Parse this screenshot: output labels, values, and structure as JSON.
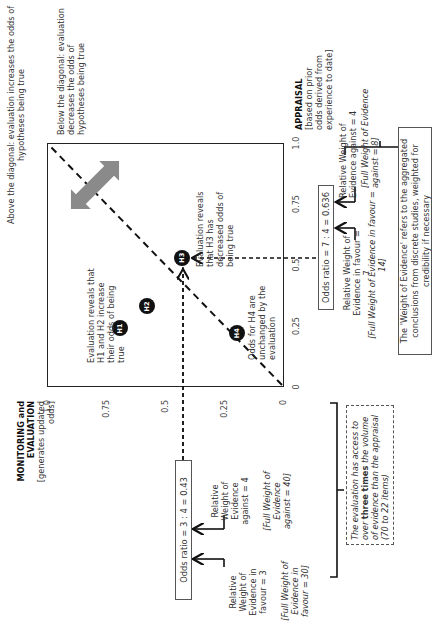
{
  "diagram": {
    "above_diagonal_note": "Above the diagonal: evaluation increases the odds of hypotheses being true",
    "below_diagonal_note": "Below the diagonal: evaluation decreases the odds of hypotheses being true",
    "y_axis": {
      "title": "MONITORING and EVALUATION",
      "subtitle": "[generates updated odds]",
      "ticks": [
        "0",
        "0.25",
        "0.5",
        "0.75",
        "1.0"
      ]
    },
    "x_axis": {
      "title": "APPRAISAL",
      "subtitle": "[based on prior odds derived from experience to date]",
      "ticks": [
        "0",
        "0.25",
        "0.5",
        "0.75",
        "1.0"
      ]
    },
    "hypotheses": [
      {
        "label": "H1",
        "appraisal": 0.24,
        "evaluation": 0.69
      },
      {
        "label": "H2",
        "appraisal": 0.33,
        "evaluation": 0.58
      },
      {
        "label": "H3",
        "appraisal": 0.53,
        "evaluation": 0.43
      },
      {
        "label": "H4",
        "appraisal": 0.22,
        "evaluation": 0.2
      }
    ],
    "annotations": {
      "h1_h2": "Evaluation reveals that H1 and H2 increase their odds of being true",
      "h3": "Evaluation reveals that H3 has decreased odds of being true",
      "h4": "Odds for H4 are unchanged by the evaluation"
    },
    "evaluation_odds": {
      "ratio_label": "Odds ratio = 3 : 4  = 0.43",
      "favour": "Relative Weight of Evidence in favour = 3",
      "favour_full": "[Full Weight of Evidence in favour = 30]",
      "against": "Relative Weight of Evidence against = 4",
      "against_full": "[Full Weight of Evidence against = 40]"
    },
    "appraisal_odds": {
      "ratio_label": "Odds ratio = 7 : 4  = 0.636",
      "favour": "Relative Weight of Evidence in favour = 7",
      "favour_full": "[Full Weight of Evidence in favour = 14]",
      "against": "Relative Weight of Evidence against = 4",
      "against_full": "[Full Weight of Evidence against = 8]"
    },
    "comparison_note": {
      "before": "The evaluation has access to over ",
      "emphasis": "three times",
      "after": " the volume of evidence than the appraisal (70  to 22 items)"
    },
    "weight_definition": "The 'Weight of Evidence' refers to the aggregated conclusions from discrete studies, weighted for credibility if necessary"
  }
}
